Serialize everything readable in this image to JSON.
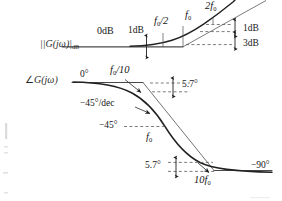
{
  "figure": {
    "kind": "bode-plot",
    "background_color": "#ffffff",
    "ink_color": "#1a1a1a",
    "curve_color": "#2b2b2b",
    "dashed_color": "#555555"
  },
  "magnitude_plot": {
    "y_axis_label": "|G(jω)|",
    "y_axis_label_sub": "dB",
    "flat_asymptote_label": "0dB",
    "annotations": [
      {
        "id": "one-db-left",
        "text": "1dB",
        "x": 132,
        "y": 31
      },
      {
        "id": "f0-over-2",
        "text": "f",
        "sub": "0",
        "tail": "/2",
        "x": 155,
        "y": 22
      },
      {
        "id": "f0-mag",
        "text": "f",
        "sub": "0",
        "x": 188,
        "y": 16
      },
      {
        "id": "two-f0",
        "text": "2f",
        "sub": "0",
        "x": 209,
        "y": 6
      },
      {
        "id": "one-db-right",
        "text": "1dB",
        "x": 239,
        "y": 29
      },
      {
        "id": "three-db",
        "text": "3dB",
        "x": 239,
        "y": 44
      }
    ]
  },
  "phase_plot": {
    "y_axis_label": "∠G(jω)",
    "zero_deg_label": "0°",
    "annotations": [
      {
        "id": "f0-over-10",
        "text": "f",
        "sub": "0",
        "tail": "/10",
        "x": 113,
        "y": 71
      },
      {
        "id": "five-point-7-top",
        "text": "5.7°",
        "x": 180,
        "y": 84
      },
      {
        "id": "slope",
        "text": "−45°/dec",
        "x": 90,
        "y": 103
      },
      {
        "id": "minus-45",
        "text": "−45°",
        "x": 104,
        "y": 126
      },
      {
        "id": "f0-phase",
        "text": "f",
        "sub": "0",
        "x": 148,
        "y": 138
      },
      {
        "id": "five-point-7-bottom",
        "text": "5.7°",
        "x": 148,
        "y": 174
      },
      {
        "id": "ten-f0",
        "text": "10f",
        "sub": "0",
        "x": 198,
        "y": 183
      },
      {
        "id": "minus-90",
        "text": "−90°",
        "x": 251,
        "y": 168
      }
    ]
  },
  "breakpoints": {
    "f0_over_10": "f0/10",
    "f0_over_2": "f0/2",
    "f0": "f0",
    "two_f0": "2f0",
    "ten_f0": "10f0"
  },
  "values": {
    "zero_db": "0dB",
    "one_db": "1dB",
    "three_db": "3dB",
    "zero_deg": "0°",
    "minus_45_deg": "−45°",
    "minus_90_deg": "−90°",
    "five_point_seven_deg": "5.7°",
    "slope_per_decade": "−45°/dec"
  }
}
